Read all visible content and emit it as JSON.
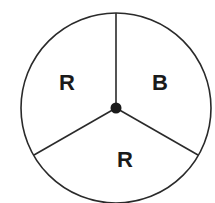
{
  "diagram": {
    "type": "spinner",
    "sections": [
      {
        "label": "R",
        "position": "upper-left"
      },
      {
        "label": "B",
        "position": "upper-right"
      },
      {
        "label": "R",
        "position": "bottom"
      }
    ],
    "colors": {
      "stroke": "#2a2a2a",
      "background": "#ffffff"
    }
  }
}
